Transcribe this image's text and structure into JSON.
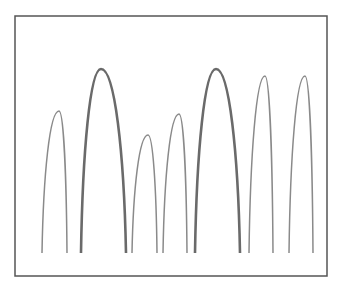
{
  "diagram": {
    "type": "arch-profiles",
    "background": "#ffffff",
    "frame": {
      "x": 15,
      "y": 16,
      "width": 312,
      "height": 260,
      "stroke": "#555555",
      "stroke_width": 1.5
    },
    "baseline_y": 253,
    "arches": [
      {
        "id": 1,
        "left_x": 42,
        "right_x": 67,
        "peak_x": 59,
        "peak_y": 111,
        "weight": "thin",
        "stroke": "#8a8a8a",
        "stroke_width": 1.5
      },
      {
        "id": 2,
        "left_x": 81,
        "right_x": 126,
        "peak_x": 101,
        "peak_y": 69,
        "weight": "thick",
        "stroke": "#6a6a6a",
        "stroke_width": 2.6
      },
      {
        "id": 3,
        "left_x": 132,
        "right_x": 157,
        "peak_x": 148,
        "peak_y": 135,
        "weight": "thin",
        "stroke": "#8a8a8a",
        "stroke_width": 1.5
      },
      {
        "id": 4,
        "left_x": 163,
        "right_x": 187,
        "peak_x": 179,
        "peak_y": 114,
        "weight": "thin",
        "stroke": "#8a8a8a",
        "stroke_width": 1.5
      },
      {
        "id": 5,
        "left_x": 195,
        "right_x": 240,
        "peak_x": 216,
        "peak_y": 69,
        "weight": "thick",
        "stroke": "#6a6a6a",
        "stroke_width": 2.6
      },
      {
        "id": 6,
        "left_x": 249,
        "right_x": 273,
        "peak_x": 265,
        "peak_y": 76,
        "weight": "thin",
        "stroke": "#8a8a8a",
        "stroke_width": 1.5
      },
      {
        "id": 7,
        "left_x": 289,
        "right_x": 313,
        "peak_x": 305,
        "peak_y": 76,
        "weight": "thin",
        "stroke": "#8a8a8a",
        "stroke_width": 1.5
      }
    ]
  }
}
